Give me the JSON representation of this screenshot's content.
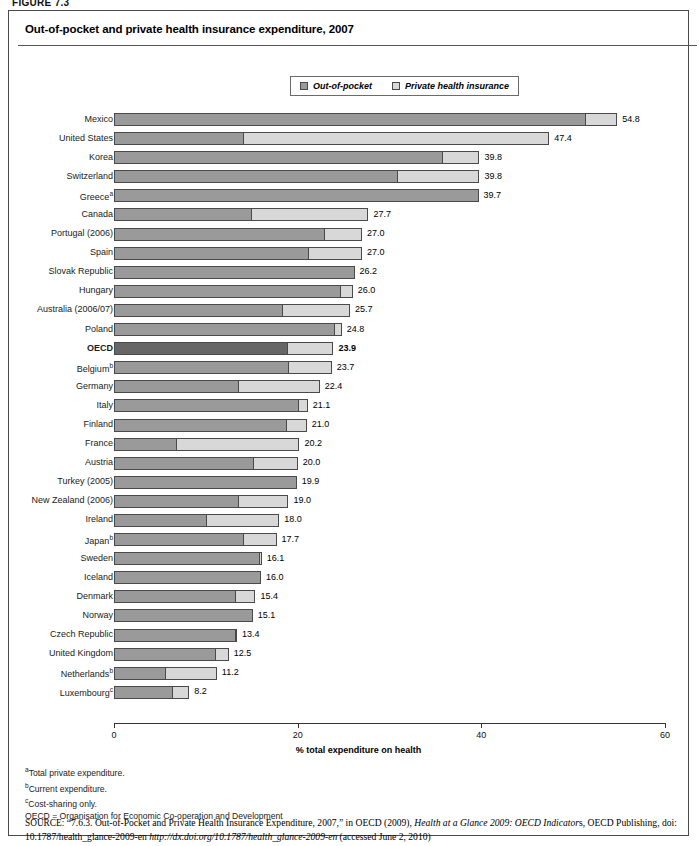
{
  "figure_label": "FIGURE 7.3",
  "chart_title": "Out-of-pocket and private health insurance expenditure, 2007",
  "legend": [
    {
      "label": "Out-of-pocket",
      "color": "#9a9a9a",
      "icon": "square-swatch-icon"
    },
    {
      "label": "Private health insurance",
      "color": "#d8d8d8",
      "icon": "square-swatch-icon"
    }
  ],
  "axis": {
    "x_title": "% total expenditure on health",
    "ticks": [
      "0",
      "20",
      "40",
      "60"
    ],
    "min": 0,
    "max": 60
  },
  "notes": [
    {
      "marker": "a",
      "text": "Total private expenditure."
    },
    {
      "marker": "b",
      "text": "Current expenditure."
    },
    {
      "marker": "c",
      "text": "Cost-sharing only."
    }
  ],
  "abbrev_note": "OECD = Organisation for Economic Co-operation and Development",
  "source": {
    "label": "SOURCE:",
    "part1": "“7.6.3. Out-of-Pocket and Private Health Insurance Expenditure, 2007,” in OECD (2009), ",
    "italic1": "Health at a Glance 2009: OECD Indicator",
    "part2": "s, OECD Publishing, doi: 10.1787/health_glance-2009-en ",
    "italic2": "http://dx.doi.org/10.1787/health_glance-2009-en",
    "part3": " (accessed June 2, 2010)"
  },
  "chart_data": {
    "type": "bar",
    "orientation": "horizontal",
    "stacked": true,
    "title": "Out-of-pocket and private health insurance expenditure, 2007",
    "xlabel": "% total expenditure on health",
    "ylabel": "",
    "xlim": [
      0,
      60
    ],
    "xticks": [
      0,
      20,
      40,
      60
    ],
    "grid": false,
    "legend_position": "top-center",
    "series": [
      {
        "name": "Out-of-pocket",
        "color": "#9a9a9a"
      },
      {
        "name": "Private health insurance",
        "color": "#d8d8d8"
      }
    ],
    "categories": [
      "Mexico",
      "United States",
      "Korea",
      "Switzerland",
      "Greeceᵃ",
      "Canada",
      "Portugal (2006)",
      "Spain",
      "Slovak Republic",
      "Hungary",
      "Australia (2006/07)",
      "Poland",
      "OECD",
      "Belgiumᵇ",
      "Germany",
      "Italy",
      "Finland",
      "France",
      "Austria",
      "Turkey (2005)",
      "New Zealand (2006)",
      "Ireland",
      "Japanᵇ (2006)",
      "Sweden",
      "Iceland",
      "Denmark",
      "Norway",
      "Czech Republic",
      "United Kingdom",
      "Netherlandsᵇ",
      "Luxembourgᶜ (2006)"
    ],
    "rows": [
      {
        "label": "Mexico",
        "label_sup": "",
        "out_of_pocket": 51.3,
        "private_insurance": 3.5,
        "total": 54.8,
        "total_text": "54.8",
        "highlight": false
      },
      {
        "label": "United States",
        "label_sup": "",
        "out_of_pocket": 14.0,
        "private_insurance": 33.4,
        "total": 47.4,
        "total_text": "47.4",
        "highlight": false
      },
      {
        "label": "Korea",
        "label_sup": "",
        "out_of_pocket": 35.7,
        "private_insurance": 4.1,
        "total": 39.8,
        "total_text": "39.8",
        "highlight": false
      },
      {
        "label": "Switzerland",
        "label_sup": "",
        "out_of_pocket": 30.8,
        "private_insurance": 9.0,
        "total": 39.8,
        "total_text": "39.8",
        "highlight": false
      },
      {
        "label": "Greece",
        "label_sup": "a",
        "out_of_pocket": 39.7,
        "private_insurance": 0.0,
        "total": 39.7,
        "total_text": "39.7",
        "highlight": false
      },
      {
        "label": "Canada",
        "label_sup": "",
        "out_of_pocket": 14.9,
        "private_insurance": 12.8,
        "total": 27.7,
        "total_text": "27.7",
        "highlight": false
      },
      {
        "label": "Portugal (2006)",
        "label_sup": "",
        "out_of_pocket": 22.9,
        "private_insurance": 4.1,
        "total": 27.0,
        "total_text": "27.0",
        "highlight": false
      },
      {
        "label": "Spain",
        "label_sup": "",
        "out_of_pocket": 21.1,
        "private_insurance": 5.9,
        "total": 27.0,
        "total_text": "27.0",
        "highlight": false
      },
      {
        "label": "Slovak Republic",
        "label_sup": "",
        "out_of_pocket": 26.2,
        "private_insurance": 0.0,
        "total": 26.2,
        "total_text": "26.2",
        "highlight": false
      },
      {
        "label": "Hungary",
        "label_sup": "",
        "out_of_pocket": 24.6,
        "private_insurance": 1.4,
        "total": 26.0,
        "total_text": "26.0",
        "highlight": false
      },
      {
        "label": "Australia (2006/07)",
        "label_sup": "",
        "out_of_pocket": 18.3,
        "private_insurance": 7.4,
        "total": 25.7,
        "total_text": "25.7",
        "highlight": false
      },
      {
        "label": "Poland",
        "label_sup": "",
        "out_of_pocket": 24.0,
        "private_insurance": 0.8,
        "total": 24.8,
        "total_text": "24.8",
        "highlight": false
      },
      {
        "label": "OECD",
        "label_sup": "",
        "out_of_pocket": 18.8,
        "private_insurance": 5.1,
        "total": 23.9,
        "total_text": "23.9",
        "highlight": true
      },
      {
        "label": "Belgium",
        "label_sup": "b",
        "out_of_pocket": 19.0,
        "private_insurance": 4.7,
        "total": 23.7,
        "total_text": "23.7",
        "highlight": false
      },
      {
        "label": "Germany",
        "label_sup": "",
        "out_of_pocket": 13.5,
        "private_insurance": 8.9,
        "total": 22.4,
        "total_text": "22.4",
        "highlight": false
      },
      {
        "label": "Italy",
        "label_sup": "",
        "out_of_pocket": 20.0,
        "private_insurance": 1.1,
        "total": 21.1,
        "total_text": "21.1",
        "highlight": false
      },
      {
        "label": "Finland",
        "label_sup": "",
        "out_of_pocket": 18.7,
        "private_insurance": 2.3,
        "total": 21.0,
        "total_text": "21.0",
        "highlight": false
      },
      {
        "label": "France",
        "label_sup": "",
        "out_of_pocket": 6.8,
        "private_insurance": 13.4,
        "total": 20.2,
        "total_text": "20.2",
        "highlight": false
      },
      {
        "label": "Austria",
        "label_sup": "",
        "out_of_pocket": 15.1,
        "private_insurance": 4.9,
        "total": 20.0,
        "total_text": "20.0",
        "highlight": false
      },
      {
        "label": "Turkey (2005)",
        "label_sup": "",
        "out_of_pocket": 19.9,
        "private_insurance": 0.0,
        "total": 19.9,
        "total_text": "19.9",
        "highlight": false
      },
      {
        "label": "New Zealand (2006)",
        "label_sup": "",
        "out_of_pocket": 13.5,
        "private_insurance": 5.5,
        "total": 19.0,
        "total_text": "19.0",
        "highlight": false
      },
      {
        "label": "Ireland",
        "label_sup": "",
        "out_of_pocket": 10.0,
        "private_insurance": 8.0,
        "total": 18.0,
        "total_text": "18.0",
        "highlight": false
      },
      {
        "label": "Japan",
        "label_sup": "b",
        "out_of_pocket": 14.1,
        "private_insurance": 3.6,
        "total": 17.7,
        "total_text": "17.7",
        "highlight": false
      },
      {
        "label": "Sweden",
        "label_sup": "",
        "out_of_pocket": 15.8,
        "private_insurance": 0.3,
        "total": 16.1,
        "total_text": "16.1",
        "highlight": false
      },
      {
        "label": "Iceland",
        "label_sup": "",
        "out_of_pocket": 16.0,
        "private_insurance": 0.0,
        "total": 16.0,
        "total_text": "16.0",
        "highlight": false
      },
      {
        "label": "Denmark",
        "label_sup": "",
        "out_of_pocket": 13.2,
        "private_insurance": 2.2,
        "total": 15.4,
        "total_text": "15.4",
        "highlight": false
      },
      {
        "label": "Norway",
        "label_sup": "",
        "out_of_pocket": 15.1,
        "private_insurance": 0.0,
        "total": 15.1,
        "total_text": "15.1",
        "highlight": false
      },
      {
        "label": "Czech Republic",
        "label_sup": "",
        "out_of_pocket": 13.2,
        "private_insurance": 0.2,
        "total": 13.4,
        "total_text": "13.4",
        "highlight": false
      },
      {
        "label": "United Kingdom",
        "label_sup": "",
        "out_of_pocket": 11.0,
        "private_insurance": 1.5,
        "total": 12.5,
        "total_text": "12.5",
        "highlight": false
      },
      {
        "label": "Netherlands",
        "label_sup": "b",
        "out_of_pocket": 5.5,
        "private_insurance": 5.7,
        "total": 11.2,
        "total_text": "11.2",
        "highlight": false
      },
      {
        "label": "Luxembourg",
        "label_sup": "c",
        "out_of_pocket": 6.3,
        "private_insurance": 1.9,
        "total": 8.2,
        "total_text": "8.2",
        "highlight": false
      }
    ]
  },
  "colors": {
    "out_of_pocket": "#9a9a9a",
    "private_insurance": "#d8d8d8",
    "oecd_highlight": "#666666",
    "border": "#4a4a4a"
  }
}
